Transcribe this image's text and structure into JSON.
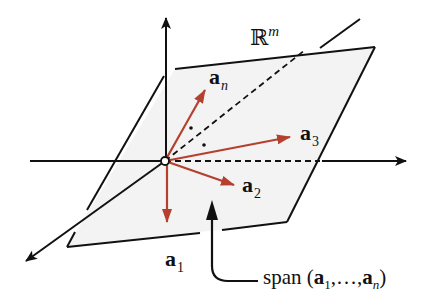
{
  "diagram": {
    "title_space": "ℝ",
    "title_space_sup": "m",
    "vectors": [
      {
        "name": "a",
        "sub": "n"
      },
      {
        "name": "a",
        "sub": "3"
      },
      {
        "name": "a",
        "sub": "2"
      },
      {
        "name": "a",
        "sub": "1"
      }
    ],
    "span_label": {
      "prefix": "span (",
      "first": "a",
      "first_sub": "1",
      "middle": ",…,",
      "last": "a",
      "last_sub": "n",
      "suffix": ")"
    },
    "colors": {
      "vector": "#b5402e",
      "plane_fill": "#f2f3f2",
      "axis": "#111111"
    }
  }
}
